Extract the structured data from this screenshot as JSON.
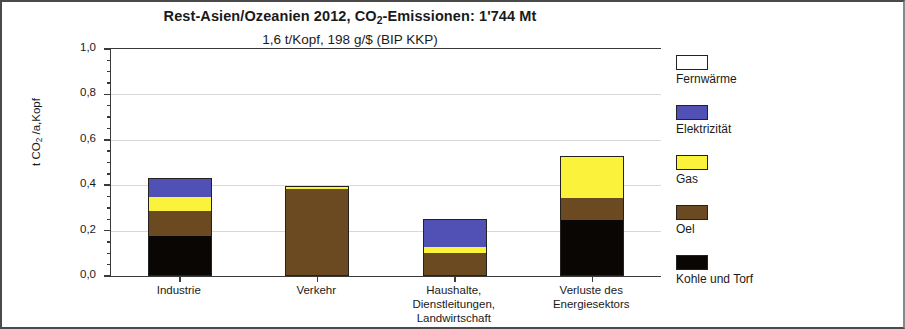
{
  "chart_data": {
    "type": "bar",
    "stacked": true,
    "title": "Rest-Asien/Ozeanien 2012, CO2-Emissionen:  1'744 Mt",
    "title_parts": {
      "before_sub": "Rest-Asien/Ozeanien 2012, CO",
      "sub": "2",
      "after_sub": "-Emissionen:  1'744 Mt"
    },
    "subtitle": "1,6 t/Kopf,    198 g/$  (BIP KKP)",
    "xlabel": "",
    "ylabel": "t CO2 /a,Kopf",
    "ylabel_parts": {
      "before_sub": "t CO",
      "sub": "2",
      "after_sub": " /a,Kopf"
    },
    "ylim": [
      0,
      1.0
    ],
    "ytick_values": [
      0.0,
      0.2,
      0.4,
      0.6,
      0.8,
      1.0
    ],
    "ytick_labels": [
      "0,0",
      "0,2",
      "0,4",
      "0,6",
      "0,8",
      "1,0"
    ],
    "yminor_step": 0.05,
    "grid": true,
    "legend_position": "right",
    "categories": [
      "Industrie",
      "Verkehr",
      "Haushalte, Dienstleitungen, Landwirtschaft",
      "Verluste des Energiesektors"
    ],
    "category_lines": [
      [
        "Industrie"
      ],
      [
        "Verkehr"
      ],
      [
        "Haushalte,",
        "Dienstleitungen,",
        "Landwirtschaft"
      ],
      [
        "Verluste des",
        "Energiesektors"
      ]
    ],
    "series": [
      {
        "name": "Kohle und Torf",
        "color": "#0a0603",
        "values": [
          0.175,
          0.0,
          0.0,
          0.245
        ]
      },
      {
        "name": "Oel",
        "color": "#6b4a22",
        "values": [
          0.11,
          0.385,
          0.1,
          0.1
        ]
      },
      {
        "name": "Gas",
        "color": "#fbf23c",
        "values": [
          0.063,
          0.01,
          0.028,
          0.183
        ]
      },
      {
        "name": "Elektrizität",
        "color": "#5150b4",
        "values": [
          0.084,
          0.0,
          0.124,
          0.0
        ]
      },
      {
        "name": "Fernwärme",
        "color": "#ffffff",
        "values": [
          0.0,
          0.0,
          0.0,
          0.0
        ]
      }
    ],
    "totals": [
      0.432,
      0.395,
      0.252,
      0.528
    ],
    "legend_order": [
      "Fernwärme",
      "Elektrizität",
      "Gas",
      "Oel",
      "Kohle und Torf"
    ],
    "colors": {
      "fernwaerme": "#ffffff",
      "elektrizitaet": "#5150b4",
      "gas": "#fbf23c",
      "oel": "#6b4a22",
      "kohle_und_torf": "#0a0603",
      "axis": "#3a3a3a",
      "grid": "#d8d8d8",
      "frame": "#4a4a4a",
      "text": "#1a1a1a"
    }
  }
}
